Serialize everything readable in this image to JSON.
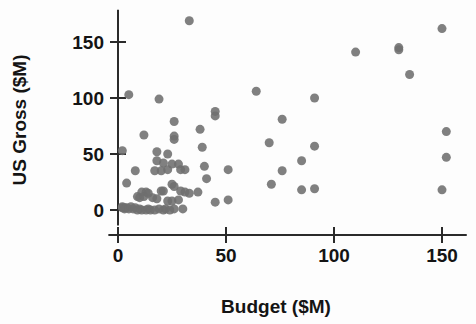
{
  "chart_data": {
    "type": "scatter",
    "title": "",
    "xlabel": "Budget ($M)",
    "ylabel": "US Gross ($M)",
    "xlim": [
      -4,
      161
    ],
    "ylim": [
      -13,
      178
    ],
    "xticks": [
      0,
      50,
      100,
      150
    ],
    "yticks": [
      0,
      50,
      100,
      150
    ],
    "xtick_labels": [
      "0",
      "50",
      "100",
      "150"
    ],
    "ytick_labels": [
      "0",
      "50",
      "100",
      "150"
    ],
    "grid": false,
    "legend": "none",
    "marker": {
      "shape": "circle",
      "color": "#6e6e6e",
      "size_px": 9,
      "opacity": 0.88
    },
    "series": [
      {
        "name": "Films",
        "n_points": 88,
        "points": [
          [
            33,
            169
          ],
          [
            5,
            103
          ],
          [
            19,
            99
          ],
          [
            45,
            88
          ],
          [
            45,
            84
          ],
          [
            26,
            79
          ],
          [
            12,
            67
          ],
          [
            26,
            66
          ],
          [
            26,
            63
          ],
          [
            38,
            72
          ],
          [
            64,
            106
          ],
          [
            91,
            100
          ],
          [
            110,
            141
          ],
          [
            130,
            145
          ],
          [
            130,
            143
          ],
          [
            135,
            121
          ],
          [
            150,
            162
          ],
          [
            152,
            70
          ],
          [
            152,
            47
          ],
          [
            150,
            18
          ],
          [
            2,
            53
          ],
          [
            18,
            52
          ],
          [
            23,
            50
          ],
          [
            39,
            56
          ],
          [
            70,
            60
          ],
          [
            76,
            81
          ],
          [
            91,
            57
          ],
          [
            85,
            44
          ],
          [
            18,
            44
          ],
          [
            21,
            42
          ],
          [
            25,
            41
          ],
          [
            28,
            41
          ],
          [
            8,
            35
          ],
          [
            17,
            35
          ],
          [
            20,
            35
          ],
          [
            23,
            36
          ],
          [
            29,
            36
          ],
          [
            31,
            36
          ],
          [
            40,
            39
          ],
          [
            51,
            36
          ],
          [
            76,
            35
          ],
          [
            41,
            28
          ],
          [
            4,
            24
          ],
          [
            25,
            23
          ],
          [
            26,
            21
          ],
          [
            71,
            23
          ],
          [
            85,
            18
          ],
          [
            91,
            19
          ],
          [
            11,
            16
          ],
          [
            13,
            16
          ],
          [
            14,
            15
          ],
          [
            20,
            17
          ],
          [
            21,
            17
          ],
          [
            29,
            17
          ],
          [
            31,
            16
          ],
          [
            33,
            15
          ],
          [
            37,
            16
          ],
          [
            9,
            12
          ],
          [
            10,
            11
          ],
          [
            12,
            12
          ],
          [
            16,
            11
          ],
          [
            18,
            10
          ],
          [
            23,
            8
          ],
          [
            25,
            8
          ],
          [
            28,
            9
          ],
          [
            45,
            7
          ],
          [
            51,
            9
          ],
          [
            2,
            3
          ],
          [
            2,
            2
          ],
          [
            3,
            2
          ],
          [
            3,
            1
          ],
          [
            4,
            2
          ],
          [
            5,
            1
          ],
          [
            6,
            3
          ],
          [
            7,
            1
          ],
          [
            8,
            2
          ],
          [
            9,
            0
          ],
          [
            10,
            1
          ],
          [
            11,
            0
          ],
          [
            13,
            0
          ],
          [
            14,
            1
          ],
          [
            15,
            0
          ],
          [
            17,
            0
          ],
          [
            19,
            1
          ],
          [
            21,
            0
          ],
          [
            22,
            1
          ],
          [
            24,
            0
          ],
          [
            26,
            1
          ],
          [
            30,
            1
          ]
        ]
      }
    ]
  }
}
